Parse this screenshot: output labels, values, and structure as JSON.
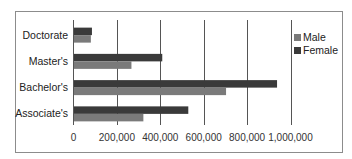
{
  "chart_data": {
    "type": "bar",
    "orientation": "horizontal",
    "title": "",
    "xlabel": "",
    "ylabel": "",
    "categories": [
      "Doctorate",
      "Master's",
      "Bachelor's",
      "Associate's"
    ],
    "series": [
      {
        "name": "Male",
        "color": "#7a7a7a",
        "values": [
          80000,
          267000,
          703000,
          322000
        ]
      },
      {
        "name": "Female",
        "color": "#3a3a3a",
        "values": [
          85000,
          409000,
          938000,
          529000
        ]
      }
    ],
    "xlim": [
      0,
      1000000
    ],
    "xticks": [
      0,
      200000,
      400000,
      600000,
      800000,
      1000000
    ],
    "xtick_labels": [
      "0",
      "200,000",
      "400,000",
      "600,000",
      "800,000",
      "1,000,000"
    ],
    "grid": "vertical",
    "legend": {
      "placement": "right",
      "entries": [
        "Male",
        "Female"
      ]
    }
  }
}
